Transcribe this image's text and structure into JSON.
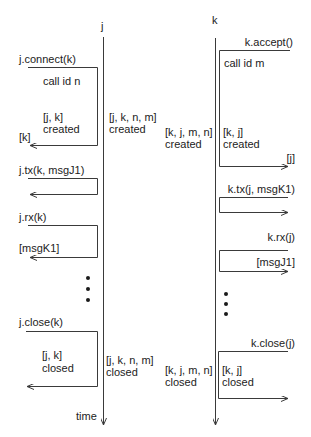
{
  "lifelines": {
    "j": {
      "label": "j"
    },
    "k": {
      "label": "k"
    },
    "time_label": "time"
  },
  "left_calls": {
    "connect": {
      "label": "j.connect(k)",
      "note": "call id n",
      "result_line1": "[j, k]",
      "result_line2": "created",
      "return_label": "[k]"
    },
    "tx": {
      "label": "j.tx(k, msgJ1)"
    },
    "rx": {
      "label": "j.rx(k)",
      "return_label": "[msgK1]"
    },
    "close": {
      "label": "j.close(k)",
      "result_line1": "[j, k]",
      "result_line2": "closed"
    }
  },
  "right_calls": {
    "accept": {
      "label": "k.accept()",
      "note": "call id m",
      "result_line1": "[k, j]",
      "result_line2": "created",
      "return_label": "[j]"
    },
    "tx": {
      "label": "k.tx(j, msgK1)"
    },
    "rx": {
      "label": "k.rx(j)",
      "return_label": "[msgJ1]"
    },
    "close": {
      "label": "k.close(j)",
      "result_line1": "[k, j]",
      "result_line2": "closed"
    }
  },
  "lifeline_states": {
    "j_created_line1": "[j, k, n, m]",
    "j_created_line2": "created",
    "k_created_line1": "[k, j, m, n]",
    "k_created_line2": "created",
    "j_closed_line1": "[j, k, n, m]",
    "j_closed_line2": "closed",
    "k_closed_line1": "[k, j, m, n]",
    "k_closed_line2": "closed"
  },
  "ellipsis": "..."
}
